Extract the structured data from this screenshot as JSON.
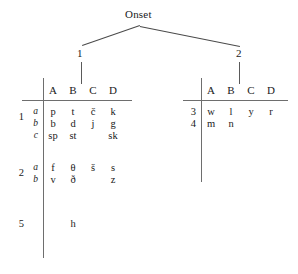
{
  "diagram": {
    "title": "Onset",
    "tree": {
      "root_label": "Onset",
      "children": [
        {
          "label": "1",
          "target": "left-table"
        },
        {
          "label": "2",
          "target": "right-table"
        }
      ]
    },
    "left_table": {
      "columns": [
        "A",
        "B",
        "C",
        "D"
      ],
      "groups": [
        {
          "number": "1",
          "rows": [
            {
              "sub": "a",
              "cells": [
                "p",
                "t",
                "č",
                "k"
              ]
            },
            {
              "sub": "b",
              "cells": [
                "b",
                "d",
                "j",
                "g"
              ]
            },
            {
              "sub": "c",
              "cells": [
                "sp",
                "st",
                "",
                "sk"
              ]
            }
          ]
        },
        {
          "number": "2",
          "rows": [
            {
              "sub": "a",
              "cells": [
                "f",
                "θ",
                "š",
                "s"
              ]
            },
            {
              "sub": "b",
              "cells": [
                "v",
                "ð",
                "",
                "z"
              ]
            }
          ]
        },
        {
          "number": "5",
          "rows": [
            {
              "sub": "",
              "cells": [
                "",
                "h",
                "",
                ""
              ]
            }
          ]
        }
      ]
    },
    "right_table": {
      "columns": [
        "A",
        "B",
        "C",
        "D"
      ],
      "groups": [
        {
          "number": "3",
          "rows": [
            {
              "sub": "",
              "cells": [
                "w",
                "l",
                "y",
                "r"
              ]
            }
          ]
        },
        {
          "number": "4",
          "rows": [
            {
              "sub": "",
              "cells": [
                "m",
                "n",
                "",
                ""
              ]
            }
          ]
        }
      ]
    }
  }
}
